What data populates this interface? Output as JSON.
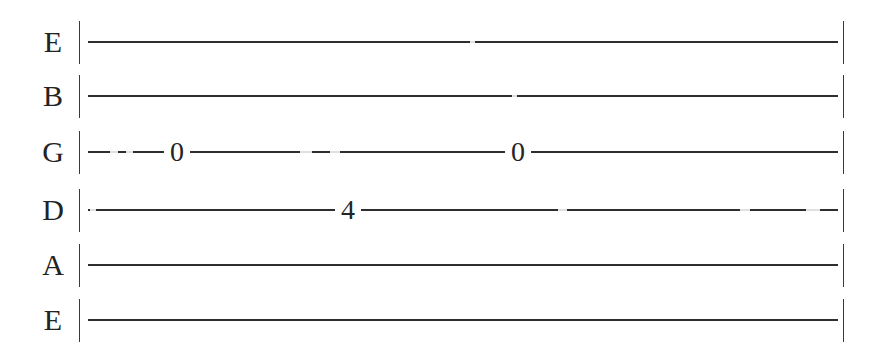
{
  "document": {
    "kind": "guitar-tablature",
    "title": "Guitar Tab Staff",
    "width": 885,
    "height": 357,
    "background_color": "#ffffff",
    "ink_color": "#2e2e2e",
    "text_color": "#232323"
  },
  "tab": {
    "string_count": 6,
    "tuning": [
      "E",
      "B",
      "G",
      "D",
      "A",
      "E"
    ],
    "left_barline": "|",
    "right_barline": "|",
    "line_start_x": 88,
    "line_end_x": 838,
    "strings": [
      {
        "index": 0,
        "label": "E",
        "name": "high-e-string",
        "y": 42,
        "notes": []
      },
      {
        "index": 1,
        "label": "B",
        "name": "b-string",
        "y": 96,
        "notes": []
      },
      {
        "index": 2,
        "label": "G",
        "name": "g-string",
        "y": 152,
        "notes": [
          {
            "fret": "0",
            "x": 177
          },
          {
            "fret": "0",
            "x": 518
          }
        ]
      },
      {
        "index": 3,
        "label": "D",
        "name": "d-string",
        "y": 210,
        "notes": [
          {
            "fret": "4",
            "x": 348
          }
        ]
      },
      {
        "index": 4,
        "label": "A",
        "name": "a-string",
        "y": 265,
        "notes": []
      },
      {
        "index": 5,
        "label": "E",
        "name": "low-e-string",
        "y": 320,
        "notes": []
      }
    ]
  },
  "scan_artifacts": {
    "description": "faint breaks in the printed rules from scanning",
    "gaps": [
      {
        "string": 2,
        "x": 110,
        "w": 8
      },
      {
        "string": 2,
        "x": 126,
        "w": 7
      },
      {
        "string": 2,
        "x": 300,
        "w": 12
      },
      {
        "string": 2,
        "x": 330,
        "w": 10
      },
      {
        "string": 3,
        "x": 90,
        "w": 6
      },
      {
        "string": 3,
        "x": 558,
        "w": 9
      },
      {
        "string": 3,
        "x": 740,
        "w": 10
      },
      {
        "string": 3,
        "x": 806,
        "w": 14
      },
      {
        "string": 0,
        "x": 470,
        "w": 5
      },
      {
        "string": 1,
        "x": 512,
        "w": 5
      }
    ]
  }
}
